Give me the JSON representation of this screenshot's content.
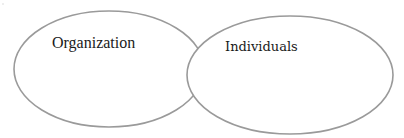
{
  "diagram": {
    "type": "venn",
    "stroke_color": "#9a9a9a",
    "fill_color": "#ffffff",
    "text_color": "#1a1a1a",
    "sets": [
      {
        "id": "organization",
        "label": "Organization",
        "shape": {
          "cx": 109,
          "cy": 69,
          "rx": 95,
          "ry": 58
        },
        "label_pos": {
          "x": 52,
          "y": 48
        }
      },
      {
        "id": "individuals",
        "label": "Individuals",
        "shape": {
          "cx": 290,
          "cy": 75,
          "rx": 103,
          "ry": 59
        },
        "label_pos": {
          "x": 225,
          "y": 51
        }
      }
    ],
    "overlap": true
  }
}
